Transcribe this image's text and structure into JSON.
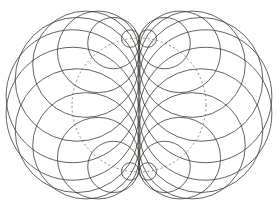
{
  "figure": {
    "title": "",
    "background": "#ffffff",
    "stroke_color": "#3a3a35",
    "guide_color": "#6a6a64",
    "center": [
      139,
      105
    ],
    "guide_radius": 67,
    "circle_count": 24,
    "tangent_line_x": 139
  }
}
